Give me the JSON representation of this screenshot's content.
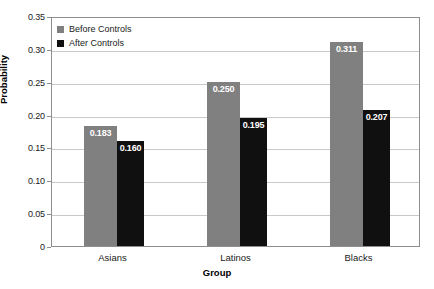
{
  "chart_data": {
    "type": "bar",
    "title": "",
    "xlabel": "Group",
    "ylabel": "Probability",
    "categories": [
      "Asians",
      "Latinos",
      "Blacks"
    ],
    "series": [
      {
        "name": "Before Controls",
        "color": "#808080",
        "values": [
          0.183,
          0.25,
          0.311
        ],
        "labels": [
          "0.183",
          "0.250",
          "0.311"
        ]
      },
      {
        "name": "After Controls",
        "color": "#101010",
        "values": [
          0.16,
          0.195,
          0.207
        ],
        "labels": [
          "0.160",
          "0.195",
          "0.207"
        ]
      }
    ],
    "ylim": [
      0,
      0.35
    ],
    "yticks": [
      0,
      0.05,
      0.1,
      0.15,
      0.2,
      0.25,
      0.3,
      0.35
    ],
    "ytick_labels": [
      "0",
      "0.05",
      "0.10",
      "0.15",
      "0.20",
      "0.25",
      "0.30",
      "0.35"
    ],
    "grid": true,
    "legend_position": "top-left",
    "bar_value_labels": true
  },
  "legend": {
    "items": [
      {
        "label": "Before Controls",
        "swatch": "before"
      },
      {
        "label": "After Controls",
        "swatch": "after"
      }
    ]
  },
  "axes": {
    "y_title": "Probability",
    "x_title": "Group"
  }
}
